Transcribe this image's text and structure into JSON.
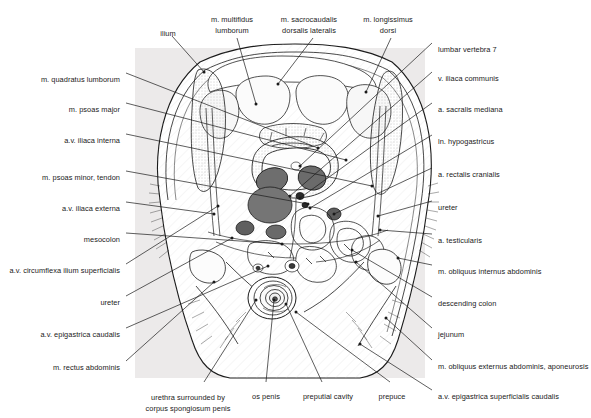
{
  "figure": {
    "background_color": "#ffffff",
    "plate_background_color": "#eceaea",
    "organ_fill_dark": "#6b6b6b",
    "organ_fill_mid": "#9a9a9a",
    "line_color": "#1a1a1a"
  },
  "labels": {
    "top": [
      {
        "id": "ilium",
        "text": "ilium",
        "x": 168,
        "y": 29,
        "align": "center"
      },
      {
        "id": "m-multifidus-lumborum",
        "text": "m. multifidus\nlumborum",
        "x": 232,
        "y": 14,
        "align": "center"
      },
      {
        "id": "m-sacrocaudalis-dorsalis-lateralis",
        "text": "m. sacrocaudalis\ndorsalis lateralis",
        "x": 309,
        "y": 14,
        "align": "center"
      },
      {
        "id": "m-longissimus-dorsi",
        "text": "m. longissimus\ndorsi",
        "x": 388,
        "y": 14,
        "align": "center"
      }
    ],
    "left": [
      {
        "id": "m-quadratus-lumborum",
        "text": "m. quadratus lumborum",
        "x": 120,
        "y": 75,
        "align": "right"
      },
      {
        "id": "m-psoas-major",
        "text": "m. psoas major",
        "x": 120,
        "y": 105,
        "align": "right"
      },
      {
        "id": "av-iliaca-interna",
        "text": "a.v. iliaca interna",
        "x": 120,
        "y": 136,
        "align": "right"
      },
      {
        "id": "m-psoas-minor-tendon",
        "text": "m. psoas minor, tendon",
        "x": 120,
        "y": 173,
        "align": "right"
      },
      {
        "id": "av-iliaca-externa",
        "text": "a.v. iliaca externa",
        "x": 120,
        "y": 204,
        "align": "right"
      },
      {
        "id": "mesocolon",
        "text": "mesocolon",
        "x": 120,
        "y": 235,
        "align": "right"
      },
      {
        "id": "av-circumflexa-ilium-superficialis",
        "text": "a.v. circumflexa ilium superficialis",
        "x": 120,
        "y": 266,
        "align": "right"
      },
      {
        "id": "ureter-left",
        "text": "ureter",
        "x": 120,
        "y": 298,
        "align": "right"
      },
      {
        "id": "av-epigastrica-caudalis",
        "text": "a.v. epigastrica caudalis",
        "x": 120,
        "y": 330,
        "align": "right"
      },
      {
        "id": "m-rectus-abdominis",
        "text": "m. rectus abdominis",
        "x": 120,
        "y": 363,
        "align": "right"
      }
    ],
    "right": [
      {
        "id": "lumbar-vertebra-7",
        "text": "lumbar vertebra 7",
        "x": 438,
        "y": 45,
        "align": "left"
      },
      {
        "id": "v-iliaca-communis",
        "text": "v. iliaca communis",
        "x": 438,
        "y": 74,
        "align": "left"
      },
      {
        "id": "a-sacralis-mediana",
        "text": "a. sacralis mediana",
        "x": 438,
        "y": 105,
        "align": "left"
      },
      {
        "id": "ln-hypogastricus",
        "text": "ln. hypogastricus",
        "x": 438,
        "y": 137,
        "align": "left"
      },
      {
        "id": "a-rectalis-cranialis",
        "text": "a. rectalis cranialis",
        "x": 438,
        "y": 170,
        "align": "left"
      },
      {
        "id": "ureter-right",
        "text": "ureter",
        "x": 438,
        "y": 203,
        "align": "left"
      },
      {
        "id": "a-testicularis",
        "text": "a. testicularis",
        "x": 438,
        "y": 236,
        "align": "left"
      },
      {
        "id": "m-obliquus-internus-abdominis",
        "text": "m. obliquus internus abdominis",
        "x": 438,
        "y": 267,
        "align": "left"
      },
      {
        "id": "descending-colon",
        "text": "descending colon",
        "x": 438,
        "y": 299,
        "align": "left"
      },
      {
        "id": "jejunum",
        "text": "jejunum",
        "x": 438,
        "y": 330,
        "align": "left"
      },
      {
        "id": "m-obliquus-externus-abdominis-aponeurosis",
        "text": "m. obliquus externus abdominis, aponeurosis",
        "x": 438,
        "y": 362,
        "align": "left"
      },
      {
        "id": "av-epigastrica-superficialis-caudalis",
        "text": "a.v. epigastrica superficialis caudalis",
        "x": 438,
        "y": 392,
        "align": "left"
      }
    ],
    "bottom": [
      {
        "id": "urethra-corpus-spongiosum-penis",
        "text": "urethra surrounded by\ncorpus spongiosum penis",
        "x": 188,
        "y": 392,
        "align": "center"
      },
      {
        "id": "os-penis",
        "text": "os penis",
        "x": 266,
        "y": 392,
        "align": "center"
      },
      {
        "id": "preputial-cavity",
        "text": "preputial cavity",
        "x": 328,
        "y": 392,
        "align": "center"
      },
      {
        "id": "prepuce",
        "text": "prepuce",
        "x": 392,
        "y": 392,
        "align": "center"
      }
    ]
  }
}
